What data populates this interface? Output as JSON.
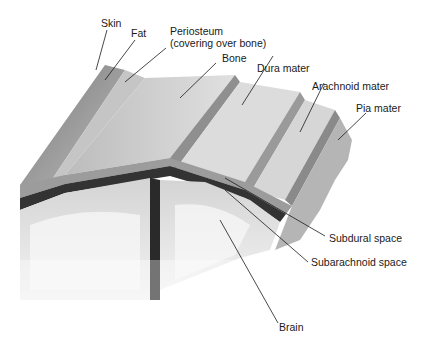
{
  "diagram": {
    "labels": {
      "skin": "Skin",
      "fat": "Fat",
      "periosteum_line1": "Periosteum",
      "periosteum_line2": "(covering over bone)",
      "bone": "Bone",
      "dura_mater": "Dura mater",
      "arachnoid_mater": "Arachnoid mater",
      "pia_mater": "Pia mater",
      "subdural_space": "Subdural space",
      "subarachnoid_space": "Subarachnoid space",
      "brain": "Brain"
    },
    "colors": {
      "ink": "#1a1a1a",
      "skin": "#9a9a9a",
      "bone": "#c8c8c8",
      "dura": "#dadada",
      "brain": "#ededed",
      "dark": "#222222"
    }
  }
}
